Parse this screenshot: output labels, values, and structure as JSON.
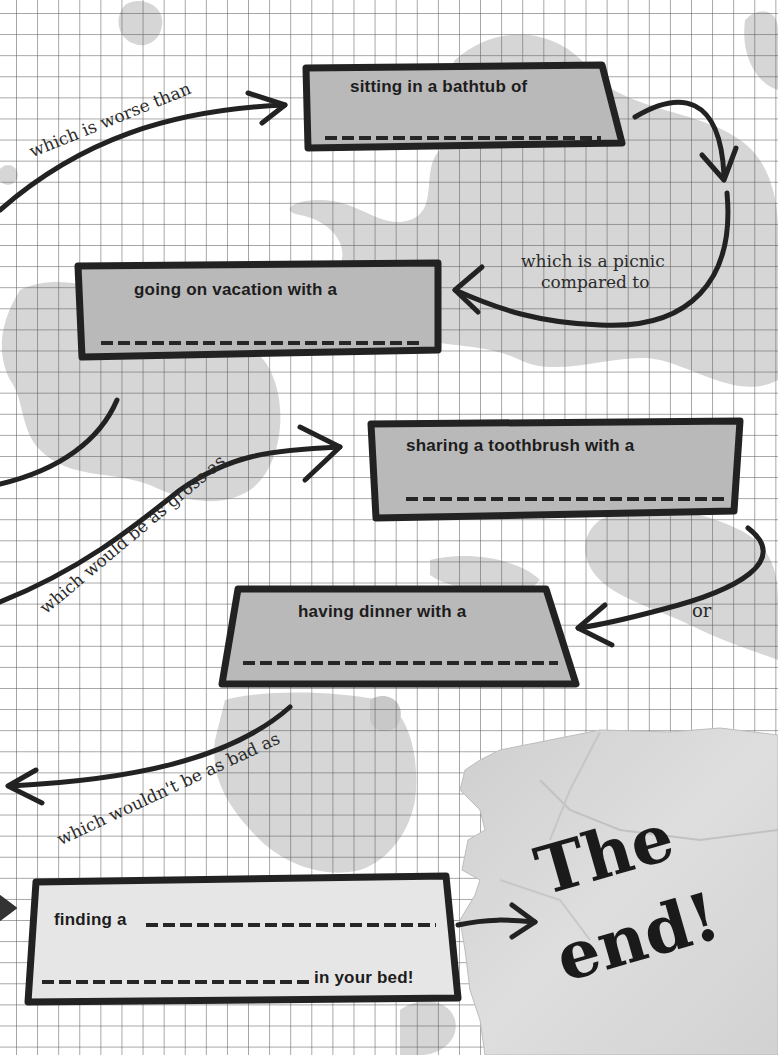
{
  "colors": {
    "paper": "#ffffff",
    "grid_line": "#5a5a5a",
    "blob": "#d4d4d4",
    "box_fill_dark": "#b9b9b9",
    "box_fill_light": "#e6e6e6",
    "box_stroke": "#222222",
    "torn_paper": "#d9d9d9",
    "ink": "#1d1d1d"
  },
  "flow": {
    "boxes": [
      {
        "id": "bathtub",
        "text": "sitting in a bathtub of",
        "blank": "___________________"
      },
      {
        "id": "vacation",
        "text": "going on vacation with a",
        "blank": "___________________"
      },
      {
        "id": "toothbrush",
        "text": "sharing a toothbrush with a",
        "blank": "___________________"
      },
      {
        "id": "dinner",
        "text": "having dinner with a",
        "blank": "___________________"
      },
      {
        "id": "bed",
        "text_start": "finding a",
        "text_end": "in your bed!",
        "blank": "___________________"
      }
    ],
    "connectors": [
      {
        "id": "worse",
        "text": "which is worse than"
      },
      {
        "id": "picnic_line1",
        "text": "which is a picnic"
      },
      {
        "id": "picnic_line2",
        "text": "compared to"
      },
      {
        "id": "gross",
        "text": "which would be as gross as"
      },
      {
        "id": "or",
        "text": "or"
      },
      {
        "id": "bad",
        "text": "which wouldn't be as bad as"
      }
    ],
    "ending": {
      "line1": "The",
      "line2": "end!"
    }
  }
}
